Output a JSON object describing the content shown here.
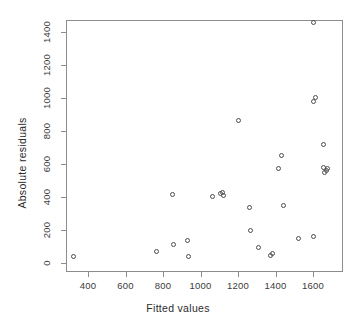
{
  "chart_data": {
    "type": "scatter",
    "title": "",
    "xlabel": "Fitted values",
    "ylabel": "Absolute residuals",
    "xlim": [
      300,
      1720
    ],
    "ylim": [
      -10,
      1500
    ],
    "xticks": [
      400,
      600,
      800,
      1000,
      1200,
      1400,
      1600
    ],
    "xtick_labels": [
      "400",
      "600",
      "800",
      "1000",
      "1200",
      "1400",
      "1600"
    ],
    "yticks": [
      0,
      200,
      400,
      600,
      800,
      1000,
      1200,
      1400
    ],
    "ytick_labels": [
      "0",
      "200",
      "400",
      "600",
      "800",
      "1000",
      "1200",
      "1400"
    ],
    "grid": false,
    "legend": null,
    "marker": "open-circle",
    "marker_color": "#4d4d4d",
    "frame_color": "#8c8c8c",
    "background": "#ffffff",
    "n_points": 29,
    "points": [
      {
        "x": 325,
        "y": 42
      },
      {
        "x": 765,
        "y": 67
      },
      {
        "x": 850,
        "y": 418
      },
      {
        "x": 855,
        "y": 115
      },
      {
        "x": 930,
        "y": 135
      },
      {
        "x": 935,
        "y": 42
      },
      {
        "x": 1062,
        "y": 402
      },
      {
        "x": 1105,
        "y": 420
      },
      {
        "x": 1115,
        "y": 425
      },
      {
        "x": 1120,
        "y": 412
      },
      {
        "x": 1205,
        "y": 862
      },
      {
        "x": 1262,
        "y": 338
      },
      {
        "x": 1268,
        "y": 196
      },
      {
        "x": 1310,
        "y": 92
      },
      {
        "x": 1375,
        "y": 45
      },
      {
        "x": 1385,
        "y": 58
      },
      {
        "x": 1418,
        "y": 570
      },
      {
        "x": 1432,
        "y": 652
      },
      {
        "x": 1440,
        "y": 347
      },
      {
        "x": 1522,
        "y": 150
      },
      {
        "x": 1600,
        "y": 1460
      },
      {
        "x": 1602,
        "y": 980
      },
      {
        "x": 1605,
        "y": 160
      },
      {
        "x": 1612,
        "y": 1005
      },
      {
        "x": 1655,
        "y": 720
      },
      {
        "x": 1658,
        "y": 580
      },
      {
        "x": 1662,
        "y": 548
      },
      {
        "x": 1672,
        "y": 562
      },
      {
        "x": 1678,
        "y": 570
      }
    ]
  },
  "axes": {
    "x_label": "Fitted values",
    "y_label": "Absolute residuals"
  }
}
